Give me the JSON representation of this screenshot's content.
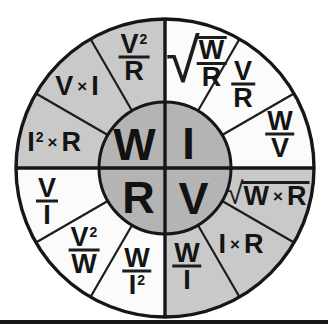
{
  "wheel": {
    "center": {
      "top_left": "W",
      "top_right": "I",
      "bottom_left": "R",
      "bottom_right": "V"
    },
    "colors": {
      "center_fill": "#b4b4b4",
      "gray_segment": "#c9c9c9",
      "light_segment": "#fbfbfb",
      "line": "#161616"
    },
    "segments": [
      {
        "formula": "V²/R",
        "type": "fraction",
        "num": "V",
        "num_sup": "2",
        "den": "R"
      },
      {
        "formula": "V×I",
        "type": "product",
        "a": "V",
        "op": "×",
        "b": "I"
      },
      {
        "formula": "I²×R",
        "type": "product",
        "a": "I",
        "a_sup": "2",
        "op": "×",
        "b": "R"
      },
      {
        "formula": "√(W/R)",
        "type": "sqrt-fraction",
        "radical": "√",
        "num": "W",
        "den": "R"
      },
      {
        "formula": "V/R",
        "type": "fraction",
        "num": "V",
        "den": "R"
      },
      {
        "formula": "W/V",
        "type": "fraction",
        "num": "W",
        "den": "V"
      },
      {
        "formula": "√(W×R)",
        "type": "sqrt-product",
        "radical": "√",
        "a": "W",
        "op": "×",
        "b": "R"
      },
      {
        "formula": "I×R",
        "type": "product",
        "a": "I",
        "op": "×",
        "b": "R"
      },
      {
        "formula": "W/I",
        "type": "fraction",
        "num": "W",
        "den": "I"
      },
      {
        "formula": "W/I²",
        "type": "fraction",
        "num": "W",
        "den": "I",
        "den_sup": "2"
      },
      {
        "formula": "V²/W",
        "type": "fraction",
        "num": "V",
        "num_sup": "2",
        "den": "W"
      },
      {
        "formula": "V/I",
        "type": "fraction",
        "num": "V",
        "den": "I"
      }
    ]
  }
}
